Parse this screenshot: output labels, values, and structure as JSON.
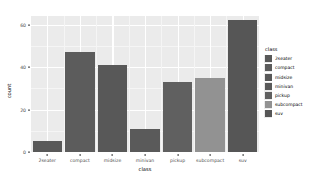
{
  "chart_data": {
    "type": "bar",
    "title": "",
    "xlabel": "class",
    "ylabel": "count",
    "categories": [
      "2seater",
      "compact",
      "midsize",
      "minivan",
      "pickup",
      "subcompact",
      "suv"
    ],
    "values": [
      5,
      47,
      41,
      11,
      33,
      35,
      62
    ],
    "ylim": [
      0,
      64
    ],
    "yticks": [
      0,
      20,
      40,
      60
    ],
    "ytick_labels": [
      "0",
      "20",
      "40",
      "60"
    ],
    "grid": true,
    "legend_position": "right",
    "legend": {
      "title": "class",
      "entries": [
        {
          "label": "2seater",
          "color": "#595959"
        },
        {
          "label": "compact",
          "color": "#5c5c5c"
        },
        {
          "label": "midsize",
          "color": "#585858"
        },
        {
          "label": "minivan",
          "color": "#5a5a5a"
        },
        {
          "label": "pickup",
          "color": "#606060"
        },
        {
          "label": "subcompact",
          "color": "#929292"
        },
        {
          "label": "suv",
          "color": "#565656"
        }
      ]
    },
    "bar_colors": [
      "#595959",
      "#5c5c5c",
      "#585858",
      "#5a5a5a",
      "#606060",
      "#929292",
      "#565656"
    ],
    "panel_background": "#ebebeb",
    "gridline_color": "#ffffff"
  }
}
